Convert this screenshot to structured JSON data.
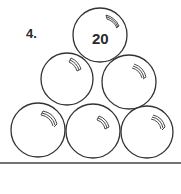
{
  "problem": {
    "number": "4."
  },
  "balls": [
    {
      "id": "top",
      "cx": 100,
      "cy": 35,
      "r": 27,
      "label": "20"
    },
    {
      "id": "middle-left",
      "cx": 67,
      "cy": 79,
      "r": 26,
      "label": ""
    },
    {
      "id": "middle-right",
      "cx": 129,
      "cy": 82,
      "r": 27,
      "label": ""
    },
    {
      "id": "bottom-left",
      "cx": 38,
      "cy": 130,
      "r": 27,
      "label": ""
    },
    {
      "id": "bottom-middle",
      "cx": 93,
      "cy": 131,
      "r": 27,
      "label": ""
    },
    {
      "id": "bottom-right",
      "cx": 147,
      "cy": 132,
      "r": 26,
      "label": ""
    }
  ],
  "colors": {
    "stroke": "#333333",
    "background": "#ffffff"
  }
}
